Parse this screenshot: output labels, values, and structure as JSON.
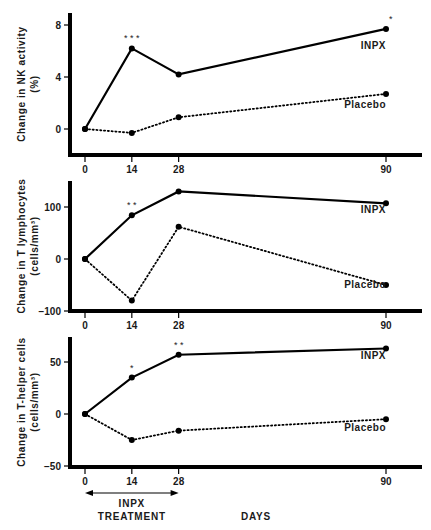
{
  "chart_data": [
    {
      "type": "line",
      "title": "",
      "xlabel": "",
      "ylabel": "Change in NK activity (%)",
      "ylabel_lines": [
        "Change in NK activity",
        "(%)"
      ],
      "x": [
        0,
        14,
        28,
        90
      ],
      "x_ticks": [
        "0",
        "14",
        "28",
        "90"
      ],
      "y_ticks": [
        0,
        4,
        8
      ],
      "ylim": [
        -2,
        9
      ],
      "series": [
        {
          "name": "INPX",
          "style": "solid",
          "values": [
            0,
            6.2,
            4.2,
            7.7
          ],
          "significance": [
            "",
            "***",
            "",
            "*"
          ]
        },
        {
          "name": "Placebo",
          "style": "dotted",
          "values": [
            0,
            -0.3,
            0.9,
            2.7
          ],
          "significance": [
            "",
            "",
            "",
            ""
          ]
        }
      ]
    },
    {
      "type": "line",
      "title": "",
      "xlabel": "",
      "ylabel": "Change in T lymphocytes (cells/mm³)",
      "ylabel_lines": [
        "Change in T lymphocytes",
        "(cells/mm³)"
      ],
      "x": [
        0,
        14,
        28,
        90
      ],
      "x_ticks": [
        "0",
        "14",
        "28",
        "90"
      ],
      "y_ticks": [
        -100,
        0,
        100
      ],
      "ylim": [
        -100,
        150
      ],
      "series": [
        {
          "name": "INPX",
          "style": "solid",
          "values": [
            0,
            84,
            130,
            107
          ],
          "significance": [
            "",
            "**",
            "",
            ""
          ]
        },
        {
          "name": "Placebo",
          "style": "dotted",
          "values": [
            0,
            -80,
            62,
            -50
          ],
          "significance": [
            "",
            "",
            "",
            ""
          ]
        }
      ]
    },
    {
      "type": "line",
      "title": "",
      "xlabel": "DAYS",
      "ylabel": "Change in T-helper cells (cells/mm³)",
      "ylabel_lines": [
        "Change in T-helper cells",
        "(cells/mm³)"
      ],
      "x": [
        0,
        14,
        28,
        90
      ],
      "x_ticks": [
        "0",
        "14",
        "28",
        "90"
      ],
      "y_ticks": [
        -50,
        0,
        50
      ],
      "ylim": [
        -50,
        75
      ],
      "series": [
        {
          "name": "INPX",
          "style": "solid",
          "values": [
            0,
            35,
            57,
            63
          ],
          "significance": [
            "",
            "*",
            "**",
            ""
          ]
        },
        {
          "name": "Placebo",
          "style": "dotted",
          "values": [
            0,
            -25,
            -16,
            -5
          ],
          "significance": [
            "",
            "",
            "",
            ""
          ]
        }
      ]
    }
  ],
  "annotations": {
    "treatment_arrow": {
      "from_day": 0,
      "to_day": 28,
      "line1": "INPX",
      "line2": "TREATMENT"
    },
    "xaxis_label": "DAYS"
  }
}
